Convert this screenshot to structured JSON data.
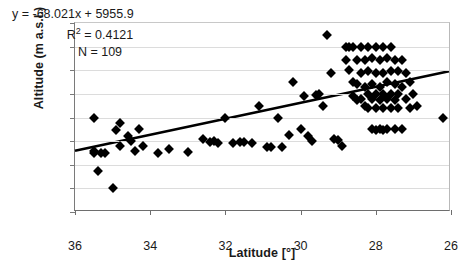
{
  "chart_data": {
    "type": "scatter",
    "title": "",
    "xlabel": "Latitude [°]",
    "ylabel": "Altitude (m a.s.l.)",
    "xlim": [
      36,
      26
    ],
    "ylim": [
      3000,
      4600
    ],
    "x_reversed": true,
    "xticks": [
      36,
      34,
      32,
      30,
      28,
      26
    ],
    "yticks": [
      3000,
      3200,
      3400,
      3600,
      3800,
      4000,
      4200,
      4400,
      4600
    ],
    "grid": "horizontal",
    "legend": "none",
    "marker": "black-diamond",
    "annotations": {
      "equation": "y = -68.021x + 5955.9",
      "r_squared_label": "R",
      "r_squared_exp": "2",
      "r_squared_value": " = 0.4121",
      "n_label": "N = 109"
    },
    "trendline": {
      "slope": -68.021,
      "intercept": 5955.9,
      "x_start": 36.0,
      "y_start": 3507.1,
      "x_end": 26.0,
      "y_end": 4187.3
    },
    "n_points": 109,
    "points": [
      [
        35.5,
        3800
      ],
      [
        35.5,
        3520
      ],
      [
        35.5,
        3500
      ],
      [
        35.4,
        3350
      ],
      [
        35.3,
        3500
      ],
      [
        35.2,
        3500
      ],
      [
        35.0,
        3200
      ],
      [
        34.9,
        3690
      ],
      [
        34.8,
        3750
      ],
      [
        34.8,
        3560
      ],
      [
        34.6,
        3640
      ],
      [
        34.5,
        3600
      ],
      [
        34.4,
        3520
      ],
      [
        34.3,
        3700
      ],
      [
        34.2,
        3560
      ],
      [
        33.8,
        3500
      ],
      [
        33.5,
        3530
      ],
      [
        33.0,
        3510
      ],
      [
        32.6,
        3620
      ],
      [
        32.4,
        3590
      ],
      [
        32.3,
        3600
      ],
      [
        32.2,
        3580
      ],
      [
        32.0,
        3800
      ],
      [
        31.8,
        3580
      ],
      [
        31.6,
        3590
      ],
      [
        31.5,
        3590
      ],
      [
        31.3,
        3580
      ],
      [
        31.1,
        3900
      ],
      [
        30.9,
        3550
      ],
      [
        30.8,
        3550
      ],
      [
        30.6,
        3800
      ],
      [
        30.5,
        3550
      ],
      [
        30.3,
        3650
      ],
      [
        30.2,
        4100
      ],
      [
        30.0,
        3700
      ],
      [
        29.9,
        3980
      ],
      [
        29.8,
        3640
      ],
      [
        29.7,
        3600
      ],
      [
        29.6,
        3990
      ],
      [
        29.5,
        4000
      ],
      [
        29.4,
        3900
      ],
      [
        29.3,
        4500
      ],
      [
        29.2,
        4180
      ],
      [
        29.1,
        3620
      ],
      [
        29.0,
        3610
      ],
      [
        28.9,
        3560
      ],
      [
        28.8,
        4400
      ],
      [
        28.8,
        4290
      ],
      [
        28.7,
        4400
      ],
      [
        28.7,
        4200
      ],
      [
        28.6,
        4400
      ],
      [
        28.6,
        4100
      ],
      [
        28.6,
        3980
      ],
      [
        28.5,
        4290
      ],
      [
        28.5,
        4080
      ],
      [
        28.5,
        3950
      ],
      [
        28.4,
        4400
      ],
      [
        28.4,
        4180
      ],
      [
        28.4,
        3960
      ],
      [
        28.3,
        4290
      ],
      [
        28.3,
        4060
      ],
      [
        28.3,
        3900
      ],
      [
        28.2,
        4400
      ],
      [
        28.2,
        4190
      ],
      [
        28.2,
        4000
      ],
      [
        28.2,
        3880
      ],
      [
        28.1,
        4300
      ],
      [
        28.1,
        4080
      ],
      [
        28.1,
        3960
      ],
      [
        28.1,
        3700
      ],
      [
        28.0,
        4400
      ],
      [
        28.0,
        4180
      ],
      [
        28.0,
        4000
      ],
      [
        28.0,
        3880
      ],
      [
        28.0,
        3690
      ],
      [
        27.9,
        4290
      ],
      [
        27.9,
        4060
      ],
      [
        27.9,
        3950
      ],
      [
        27.9,
        3700
      ],
      [
        27.8,
        4400
      ],
      [
        27.8,
        4180
      ],
      [
        27.8,
        4000
      ],
      [
        27.8,
        3880
      ],
      [
        27.8,
        3690
      ],
      [
        27.7,
        4300
      ],
      [
        27.7,
        4100
      ],
      [
        27.7,
        3960
      ],
      [
        27.7,
        3700
      ],
      [
        27.6,
        4400
      ],
      [
        27.6,
        4190
      ],
      [
        27.6,
        4000
      ],
      [
        27.6,
        3880
      ],
      [
        27.5,
        4290
      ],
      [
        27.5,
        4080
      ],
      [
        27.5,
        3950
      ],
      [
        27.5,
        3700
      ],
      [
        27.4,
        4190
      ],
      [
        27.4,
        4000
      ],
      [
        27.4,
        3880
      ],
      [
        27.3,
        4290
      ],
      [
        27.3,
        4060
      ],
      [
        27.3,
        3700
      ],
      [
        27.2,
        4180
      ],
      [
        27.2,
        3960
      ],
      [
        27.1,
        4100
      ],
      [
        27.1,
        3880
      ],
      [
        27.0,
        4000
      ],
      [
        26.9,
        3900
      ],
      [
        26.2,
        3800
      ]
    ]
  }
}
